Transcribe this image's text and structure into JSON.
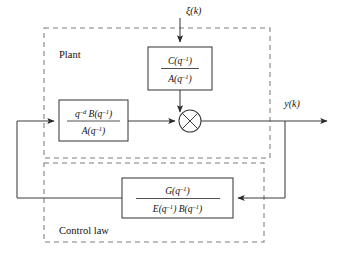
{
  "diagram": {
    "background_color": "#ffffff",
    "line_color": "#3c3c3c",
    "dashed_color": "#7d7d7d",
    "text_color": "#111111"
  },
  "regions": {
    "plant": {
      "label": "Plant",
      "x": 44,
      "y": 28,
      "width": 226,
      "height": 130
    },
    "control_law": {
      "label": "Control law",
      "x": 44,
      "y": 163,
      "width": 220,
      "height": 79
    }
  },
  "signals": {
    "disturbance": {
      "label": "ξ(k)",
      "glyph": "ξ",
      "arg": "(k)",
      "name": "disturbance-input"
    },
    "output": {
      "label": "y(k)",
      "glyph": "y",
      "arg": "(k)",
      "name": "plant-output"
    }
  },
  "blocks": {
    "noise_filter": {
      "name": "noise-filter-block",
      "numerator_base": "C",
      "numerator_arg": "(q",
      "numerator_exp": "–1",
      "numerator_close": ")",
      "denominator_base": "A",
      "denominator_arg": "(q",
      "denominator_exp": "–1",
      "denominator_close": ")",
      "numerator_text": "C(q⁻¹)",
      "denominator_text": "A(q⁻¹)",
      "x": 148,
      "y": 47,
      "width": 64,
      "height": 43
    },
    "plant_transfer": {
      "name": "plant-transfer-block",
      "numerator_prefix": "q",
      "numerator_prefix_exp": "–d",
      "numerator_base": "B",
      "numerator_arg": "(q",
      "numerator_exp": "–1",
      "numerator_close": ")",
      "denominator_base": "A",
      "denominator_arg": "(q",
      "denominator_exp": "–1",
      "denominator_close": ")",
      "numerator_text": "q⁻ᵈ B(q⁻¹)",
      "denominator_text": "A(q⁻¹)",
      "x": 59,
      "y": 100,
      "width": 69,
      "height": 41
    },
    "controller": {
      "name": "controller-block",
      "numerator_base": "G",
      "numerator_arg": "(q",
      "numerator_exp": "–1",
      "numerator_close": ")",
      "denominator_base_1": "E",
      "denominator_arg_1": "(q",
      "denominator_exp_1": "–1",
      "denominator_close_1": ")",
      "denominator_base_2": "B",
      "denominator_arg_2": "(q",
      "denominator_exp_2": "–1",
      "denominator_close_2": ")",
      "numerator_text": "G(q⁻¹)",
      "denominator_text": "E(q⁻¹) B(q⁻¹)",
      "x": 122,
      "y": 178,
      "width": 111,
      "height": 40
    }
  },
  "summation": {
    "name": "summing-junction",
    "symbol": "⊗",
    "cx": 190,
    "cy": 121,
    "r": 11
  }
}
